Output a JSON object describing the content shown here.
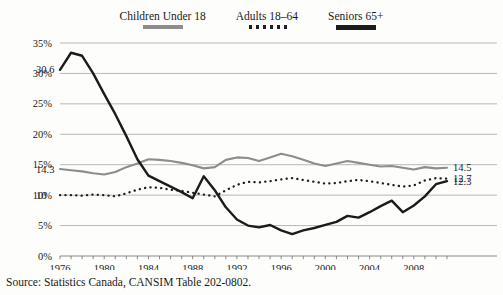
{
  "legend": {
    "position": "top-center",
    "items": [
      {
        "label": "Children Under 18",
        "style": "solid-gray",
        "color": "#8d8d8d"
      },
      {
        "label": "Adults 18–64",
        "style": "dotted",
        "color": "#1f1f1f"
      },
      {
        "label": "Seniors 65+",
        "style": "solid-dark",
        "color": "#1b1b1b"
      }
    ]
  },
  "source": {
    "text": "Source: Statistics Canada, CANSIM Table 202-0802."
  },
  "chart_data": {
    "type": "line",
    "title": "",
    "subtitle": "",
    "xlabel": "",
    "ylabel": "",
    "grid": true,
    "legend_position": "top-center",
    "xlim": [
      1976,
      2011
    ],
    "ylim": [
      0,
      35
    ],
    "ytick_step": 5,
    "ytick_labels": [
      "0%",
      "5%",
      "10%",
      "15%",
      "20%",
      "25%",
      "30%",
      "35%"
    ],
    "ytick_values": [
      0,
      5,
      10,
      15,
      20,
      25,
      30,
      35
    ],
    "xtick_labels": [
      "1976",
      "1980",
      "1984",
      "1988",
      "1992",
      "1996",
      "2000",
      "2004",
      "2008"
    ],
    "xtick_values": [
      1976,
      1980,
      1984,
      1988,
      1992,
      1996,
      2000,
      2004,
      2008
    ],
    "minor_xticks_annual": true,
    "x": [
      1976,
      1977,
      1978,
      1979,
      1980,
      1981,
      1982,
      1983,
      1984,
      1985,
      1986,
      1987,
      1988,
      1989,
      1990,
      1991,
      1992,
      1993,
      1994,
      1995,
      1996,
      1997,
      1998,
      1999,
      2000,
      2001,
      2002,
      2003,
      2004,
      2005,
      2006,
      2007,
      2008,
      2009,
      2010,
      2011
    ],
    "series": [
      {
        "name": "Children Under 18",
        "style": "solid-gray",
        "color": "#8d8d8d",
        "start_label": "14.3",
        "end_label": "14.5",
        "values": [
          14.3,
          14.1,
          13.9,
          13.6,
          13.4,
          13.8,
          14.6,
          15.2,
          15.9,
          15.8,
          15.6,
          15.3,
          14.9,
          14.4,
          14.6,
          15.8,
          16.2,
          16.1,
          15.6,
          16.2,
          16.8,
          16.4,
          15.8,
          15.2,
          14.8,
          15.2,
          15.6,
          15.3,
          15.0,
          14.7,
          14.8,
          14.5,
          14.2,
          14.6,
          14.4,
          14.5
        ]
      },
      {
        "name": "Adults 18–64",
        "style": "dotted",
        "color": "#1f1f1f",
        "start_label": "10",
        "end_label": "12.7",
        "values": [
          10.0,
          10.0,
          9.9,
          10.1,
          10.0,
          9.8,
          10.3,
          10.9,
          11.3,
          11.2,
          10.9,
          10.7,
          10.4,
          10.1,
          9.8,
          10.8,
          11.7,
          12.2,
          12.1,
          12.3,
          12.6,
          12.8,
          12.5,
          12.2,
          11.9,
          12.0,
          12.3,
          12.5,
          12.3,
          12.0,
          11.7,
          11.4,
          11.6,
          12.4,
          12.8,
          12.7
        ]
      },
      {
        "name": "Seniors 65+",
        "style": "solid-dark",
        "color": "#1b1b1b",
        "start_label": "30.6",
        "end_label": "12.3",
        "values": [
          30.6,
          33.4,
          32.9,
          30.0,
          26.6,
          23.3,
          19.7,
          15.9,
          13.2,
          12.3,
          11.4,
          10.5,
          9.5,
          13.1,
          10.8,
          8.0,
          6.0,
          5.0,
          4.7,
          5.1,
          4.2,
          3.6,
          4.2,
          4.6,
          5.1,
          5.6,
          6.6,
          6.3,
          7.2,
          8.2,
          9.1,
          7.2,
          8.3,
          9.8,
          11.8,
          12.3
        ]
      }
    ]
  }
}
